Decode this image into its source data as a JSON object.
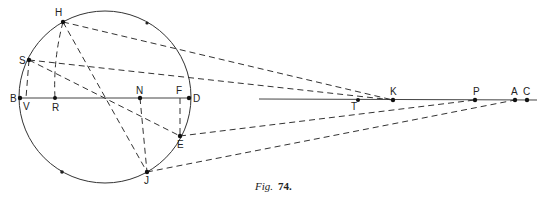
{
  "figure": {
    "caption_italic": "Fig.",
    "caption_number": "74."
  },
  "circle": {
    "cx": 105,
    "cy": 97,
    "r": 86
  },
  "points": {
    "H": {
      "label": "H",
      "x": 63,
      "y": 22
    },
    "S": {
      "label": "S",
      "x": 29,
      "y": 60
    },
    "B": {
      "label": "B",
      "x": 20,
      "y": 98
    },
    "V": {
      "label": "V",
      "x": 26,
      "y": 98
    },
    "R": {
      "label": "R",
      "x": 55,
      "y": 98
    },
    "N": {
      "label": "N",
      "x": 140,
      "y": 98
    },
    "F": {
      "label": "F",
      "x": 180,
      "y": 98
    },
    "D": {
      "label": "D",
      "x": 189,
      "y": 98
    },
    "E": {
      "label": "E",
      "x": 180,
      "y": 136
    },
    "J": {
      "label": "J",
      "x": 147,
      "y": 172
    },
    "T": {
      "label": "T",
      "x": 358,
      "y": 100
    },
    "K": {
      "label": "K",
      "x": 393,
      "y": 100
    },
    "P": {
      "label": "P",
      "x": 475,
      "y": 100
    },
    "A": {
      "label": "A",
      "x": 515,
      "y": 100
    },
    "C": {
      "label": "C",
      "x": 527,
      "y": 100
    }
  }
}
